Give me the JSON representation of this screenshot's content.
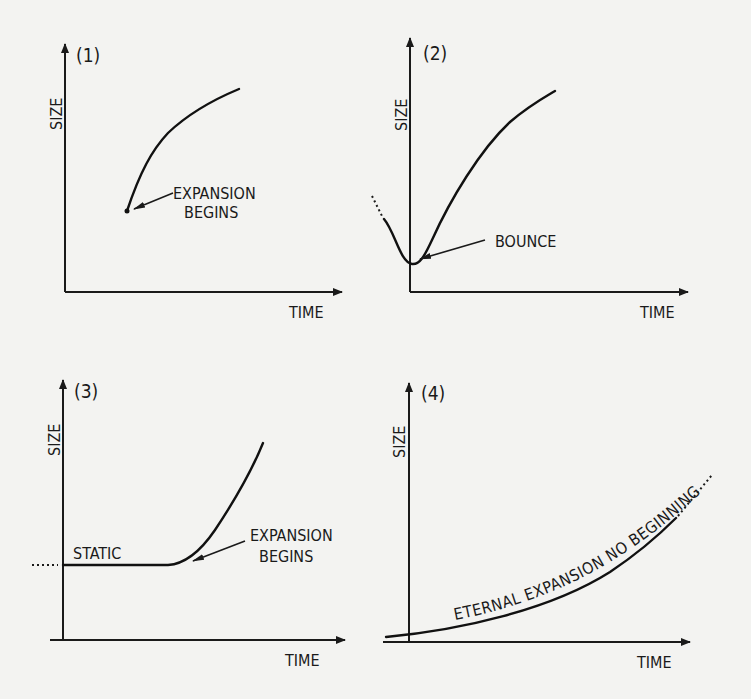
{
  "figure": {
    "background": "#f3f3f1",
    "ink": "#1a1a1a",
    "panels": [
      {
        "id": "1",
        "number_label": "(1)",
        "y_axis_label": "SIZE",
        "x_axis_label": "TIME",
        "annotations": [
          {
            "text_line1": "EXPANSION",
            "text_line2": "BEGINS"
          }
        ]
      },
      {
        "id": "2",
        "number_label": "(2)",
        "y_axis_label": "SIZE",
        "x_axis_label": "TIME",
        "annotations": [
          {
            "text_line1": "BOUNCE"
          }
        ]
      },
      {
        "id": "3",
        "number_label": "(3)",
        "y_axis_label": "SIZE",
        "x_axis_label": "TIME",
        "annotations": [
          {
            "text_line1": "STATIC"
          },
          {
            "text_line1": "EXPANSION",
            "text_line2": "BEGINS"
          }
        ]
      },
      {
        "id": "4",
        "number_label": "(4)",
        "y_axis_label": "SIZE",
        "x_axis_label": "TIME",
        "annotations": [
          {
            "text_line1": "ETERNAL EXPANSION NO BEGINNING"
          }
        ]
      }
    ]
  }
}
